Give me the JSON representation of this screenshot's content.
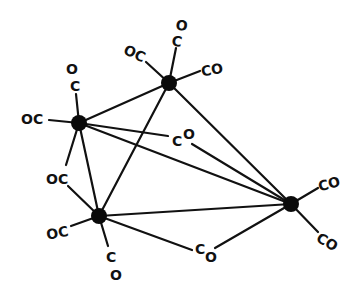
{
  "diagram": {
    "type": "chemical-structure",
    "colors": {
      "ink": "#111111",
      "atom": "#0a0a0a",
      "background": "#ffffff"
    },
    "atoms": [
      {
        "id": "M1",
        "position_desc": "top"
      },
      {
        "id": "M2",
        "position_desc": "left"
      },
      {
        "id": "M3",
        "position_desc": "bottom-left"
      },
      {
        "id": "M4",
        "position_desc": "right"
      }
    ],
    "metal_bonds": [
      [
        "M1",
        "M2"
      ],
      [
        "M1",
        "M3"
      ],
      [
        "M1",
        "M4"
      ],
      [
        "M2",
        "M3"
      ],
      [
        "M2",
        "M4"
      ],
      [
        "M3",
        "M4"
      ]
    ],
    "terminal_ligands": [
      {
        "atom": "M1",
        "label": "OC",
        "direction": "upper-left"
      },
      {
        "atom": "M1",
        "label_c": "C",
        "label_o": "O",
        "direction": "up"
      },
      {
        "atom": "M1",
        "label": "CO",
        "direction": "right"
      },
      {
        "atom": "M2",
        "label_c": "C",
        "label_o": "O",
        "direction": "up"
      },
      {
        "atom": "M2",
        "label": "OC",
        "direction": "left"
      },
      {
        "atom": "M3",
        "label": "OC",
        "direction": "left"
      },
      {
        "atom": "M3",
        "label_c": "C",
        "label_o": "O",
        "direction": "down"
      },
      {
        "atom": "M4",
        "label": "CO",
        "direction": "upper-right"
      },
      {
        "atom": "M4",
        "label": "CO",
        "direction": "lower-right"
      }
    ],
    "bridging_ligands": [
      {
        "between": [
          "M2",
          "M3"
        ],
        "label": "OC"
      },
      {
        "between": [
          "M2",
          "M4"
        ],
        "label_c": "C",
        "label_o": "O"
      },
      {
        "between": [
          "M3",
          "M4"
        ],
        "label_c": "C",
        "label_o": "O"
      }
    ]
  }
}
